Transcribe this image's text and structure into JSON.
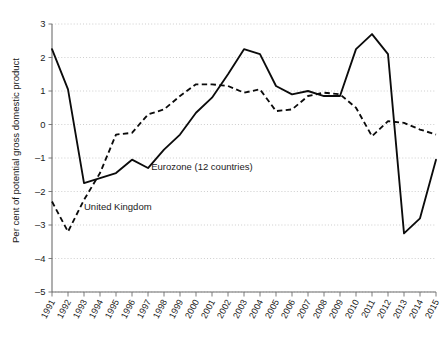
{
  "chart_data": {
    "type": "line",
    "title": "",
    "xlabel": "",
    "ylabel": "Per cent of potential gross domestic product",
    "ylim": [
      -5,
      3
    ],
    "yticks": [
      3,
      2,
      1,
      0,
      -1,
      -2,
      -3,
      -4,
      -5
    ],
    "ytick_labels": [
      "3",
      "2",
      "1",
      "0",
      "–1",
      "–2",
      "–3",
      "–4",
      "–5"
    ],
    "grid": true,
    "grid_axis": "y",
    "legend_position": "inline-annotations",
    "x": [
      1991,
      1992,
      1993,
      1994,
      1995,
      1996,
      1997,
      1998,
      1999,
      2000,
      2001,
      2002,
      2003,
      2004,
      2005,
      2006,
      2007,
      2008,
      2009,
      2010,
      2011,
      2012,
      2013,
      2014,
      2015
    ],
    "xtick_labels": [
      "1991",
      "1992",
      "1993",
      "1994",
      "1995",
      "1996",
      "1997",
      "1998",
      "1999",
      "2000",
      "2001",
      "2002",
      "2003",
      "2004",
      "2005",
      "2006",
      "2007",
      "2008",
      "2009",
      "2010",
      "2011",
      "2012",
      "2013",
      "2014",
      "2015"
    ],
    "series": [
      {
        "name": "Eurozone (12 countries)",
        "style": "solid",
        "color": "#0b0b0b",
        "values": [
          2.25,
          1.05,
          -1.75,
          -1.6,
          -1.45,
          -1.05,
          -1.3,
          -0.75,
          -0.3,
          0.35,
          0.8,
          1.5,
          2.25,
          2.1,
          1.15,
          0.9,
          1.0,
          0.85,
          0.85,
          2.25,
          2.7,
          2.1,
          -3.25,
          -2.8,
          -1.05
        ]
      },
      {
        "name": "United Kingdom",
        "style": "dashed",
        "color": "#0b0b0b",
        "values": [
          -2.3,
          -3.2,
          -2.25,
          -1.45,
          -0.3,
          -0.25,
          0.3,
          0.45,
          0.85,
          1.2,
          1.2,
          1.15,
          0.95,
          1.05,
          0.4,
          0.45,
          0.85,
          0.95,
          0.9,
          0.5,
          -0.35,
          0.1,
          0.05,
          -0.15,
          -0.3
        ]
      }
    ],
    "annotations": [
      {
        "text": "Eurozone (12 countries)",
        "x": 1997.2,
        "y": -1.35
      },
      {
        "text": "United Kingdom",
        "x": 1993.0,
        "y": -2.55
      }
    ]
  }
}
